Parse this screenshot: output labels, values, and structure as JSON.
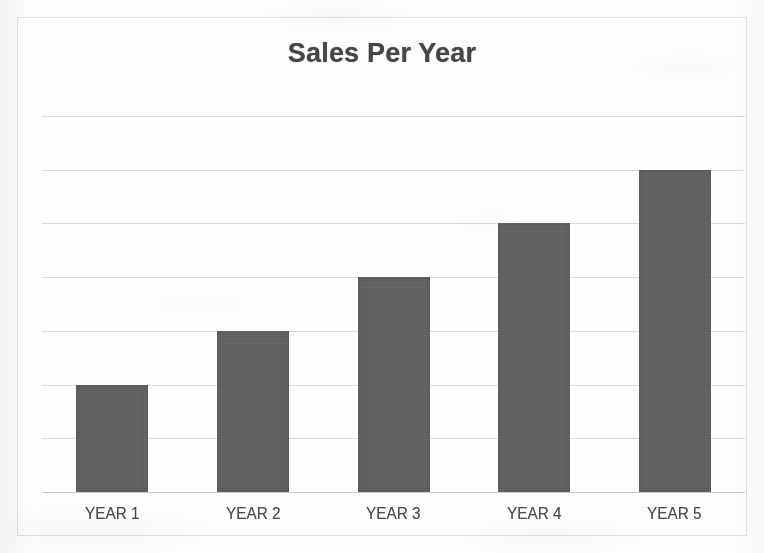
{
  "chart_data": {
    "type": "bar",
    "title": "Sales Per Year",
    "xlabel": "",
    "ylabel": "",
    "categories": [
      "YEAR 1",
      "YEAR 2",
      "YEAR 3",
      "YEAR 4",
      "YEAR 5"
    ],
    "values": [
      2,
      3,
      4,
      5,
      6
    ],
    "ylim": [
      0,
      7
    ],
    "y_tick_labels": [],
    "gridlines": 7,
    "grid": true,
    "legend": false,
    "legend_position": "none",
    "series": [
      {
        "name": "Sales",
        "values": [
          2,
          3,
          4,
          5,
          6
        ]
      }
    ],
    "annotations": []
  },
  "chart": {
    "title": "Sales Per Year",
    "colors": {
      "bar": "#5f5f5f",
      "title_text": "#464646",
      "label_text": "#4e4e4e",
      "gridline": "#dcdcdc",
      "axis": "#c9c9c9",
      "frame_border": "#e2e2e2",
      "background": "#fdfdfc"
    },
    "bars": [
      {
        "label": "YEAR 1",
        "value": 2
      },
      {
        "label": "YEAR 2",
        "value": 3
      },
      {
        "label": "YEAR 3",
        "value": 4
      },
      {
        "label": "YEAR 4",
        "value": 5
      },
      {
        "label": "YEAR 5",
        "value": 6
      }
    ]
  }
}
